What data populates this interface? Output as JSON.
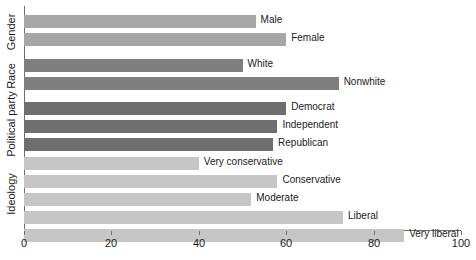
{
  "chart_data": {
    "type": "bar",
    "orientation": "horizontal",
    "title": "",
    "xlabel": "",
    "ylabel": "",
    "xlim": [
      0,
      100
    ],
    "xticks": [
      0,
      20,
      40,
      60,
      80,
      100
    ],
    "grid": false,
    "legend": "none",
    "groups": [
      {
        "name": "Gender",
        "color": "#a6a6a6",
        "categories": [
          "Male",
          "Female"
        ],
        "values": [
          53,
          60
        ]
      },
      {
        "name": "Race",
        "color": "#7f7f7f",
        "categories": [
          "White",
          "Nonwhite"
        ],
        "values": [
          50,
          72
        ]
      },
      {
        "name": "Political party",
        "color": "#6e6e6e",
        "categories": [
          "Democrat",
          "Independent",
          "Republican"
        ],
        "values": [
          60,
          58,
          57
        ]
      },
      {
        "name": "Ideology",
        "color": "#c6c6c6",
        "categories": [
          "Very conservative",
          "Conservative",
          "Moderate",
          "Liberal",
          "Very liberal"
        ],
        "values": [
          40,
          58,
          52,
          73,
          87
        ]
      }
    ],
    "bars": [
      {
        "label": "Male",
        "value": 53,
        "group": "Gender",
        "color": "#a6a6a6"
      },
      {
        "label": "Female",
        "value": 60,
        "group": "Gender",
        "color": "#a6a6a6"
      },
      {
        "label": "White",
        "value": 50,
        "group": "Race",
        "color": "#7f7f7f"
      },
      {
        "label": "Nonwhite",
        "value": 72,
        "group": "Race",
        "color": "#7f7f7f"
      },
      {
        "label": "Democrat",
        "value": 60,
        "group": "Political party",
        "color": "#6e6e6e"
      },
      {
        "label": "Independent",
        "value": 58,
        "group": "Political party",
        "color": "#6e6e6e"
      },
      {
        "label": "Republican",
        "value": 57,
        "group": "Political party",
        "color": "#6e6e6e"
      },
      {
        "label": "Very conservative",
        "value": 40,
        "group": "Ideology",
        "color": "#c6c6c6"
      },
      {
        "label": "Conservative",
        "value": 58,
        "group": "Ideology",
        "color": "#c6c6c6"
      },
      {
        "label": "Moderate",
        "value": 52,
        "group": "Ideology",
        "color": "#c6c6c6"
      },
      {
        "label": "Liberal",
        "value": 73,
        "group": "Ideology",
        "color": "#c6c6c6"
      },
      {
        "label": "Very liberal",
        "value": 87,
        "group": "Ideology",
        "color": "#c6c6c6"
      }
    ]
  },
  "axis": {
    "ticks": [
      "0",
      "20",
      "40",
      "60",
      "80",
      "100"
    ]
  },
  "group_labels": [
    "Gender",
    "Race",
    "Political party",
    "Ideology"
  ]
}
